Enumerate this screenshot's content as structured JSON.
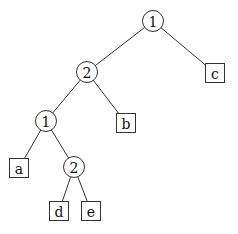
{
  "tree": {
    "nodes": [
      {
        "id": "n1",
        "label": "1",
        "shape": "circle",
        "parent": null
      },
      {
        "id": "n2",
        "label": "2",
        "shape": "circle",
        "parent": "n1"
      },
      {
        "id": "c",
        "label": "c",
        "shape": "square",
        "parent": "n1"
      },
      {
        "id": "n3",
        "label": "1",
        "shape": "circle",
        "parent": "n2"
      },
      {
        "id": "b",
        "label": "b",
        "shape": "square",
        "parent": "n2"
      },
      {
        "id": "a",
        "label": "a",
        "shape": "square",
        "parent": "n3"
      },
      {
        "id": "n4",
        "label": "2",
        "shape": "circle",
        "parent": "n3"
      },
      {
        "id": "d",
        "label": "d",
        "shape": "square",
        "parent": "n4"
      },
      {
        "id": "e",
        "label": "e",
        "shape": "square",
        "parent": "n4"
      }
    ]
  }
}
